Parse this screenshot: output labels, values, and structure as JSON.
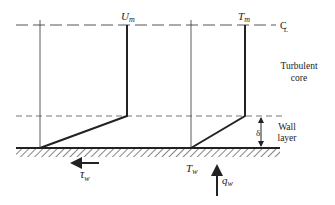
{
  "diagram": {
    "type": "boundary-layer velocity and temperature profiles",
    "labels": {
      "velocity_max": "U",
      "velocity_max_sub": "m",
      "temp_max": "T",
      "temp_max_sub": "m",
      "centerline": "C",
      "centerline_sub": "L",
      "core_line1": "Turbulent",
      "core_line2": "core",
      "wall_line1": "Wall",
      "wall_line2": "layer",
      "thickness": "δ",
      "wall_temp": "T",
      "wall_temp_sub": "w",
      "shear": "τ",
      "shear_sub": "w",
      "heat_flux": "q",
      "heat_flux_sub": "w"
    },
    "colors": {
      "ink": "#222222",
      "dashed": "#555555",
      "background": "#ffffff"
    }
  }
}
